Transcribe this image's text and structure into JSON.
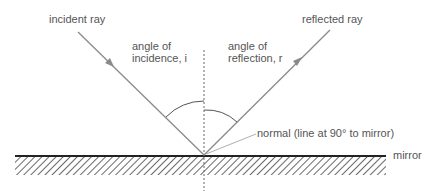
{
  "labels": {
    "incident_ray": "incident ray",
    "reflected_ray": "reflected ray",
    "angle_incidence_l1": "angle of",
    "angle_incidence_l2": "incidence, i",
    "angle_reflection_l1": "angle of",
    "angle_reflection_l2": "reflection, r",
    "normal": "normal (line at 90° to mirror)",
    "mirror": "mirror"
  },
  "colors": {
    "ray": "#8a8a8a",
    "mirror_surface": "#222222",
    "hatch": "#444444",
    "text": "#555555"
  }
}
